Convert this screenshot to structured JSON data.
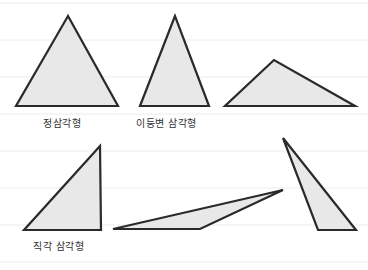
{
  "colors": {
    "background": "#ffffff",
    "guide_line": "#ececec",
    "triangle_fill": "#e8e8e8",
    "triangle_stroke": "#2a2a2a",
    "label": "#333333"
  },
  "guide_lines_y": [
    3,
    40,
    77,
    114,
    151,
    188,
    225,
    262
  ],
  "triangles": [
    {
      "name": "equilateral-triangle",
      "points": "68,16 16,106 118,106"
    },
    {
      "name": "isosceles-triangle",
      "points": "175,16 140,106 209,106"
    },
    {
      "name": "obtuse-wide-triangle",
      "points": "274,60 225,106 355,106"
    },
    {
      "name": "right-triangle",
      "points": "100,146 24,230 101,230"
    },
    {
      "name": "obtuse-flat-triangle",
      "points": "113,229 200,229 283,190"
    },
    {
      "name": "obtuse-tall-triangle",
      "points": "283,138 318,230 356,230"
    }
  ],
  "labels": {
    "equilateral": {
      "text": "정삼각형",
      "x": 43,
      "y": 115
    },
    "isosceles": {
      "text": "이등변 삼각형",
      "x": 136,
      "y": 115
    },
    "right": {
      "text": "직각 삼각형",
      "x": 33,
      "y": 238
    }
  }
}
